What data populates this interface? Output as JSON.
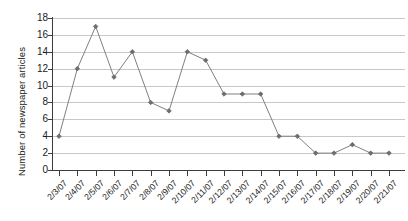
{
  "chart_data": {
    "type": "line",
    "title": "",
    "subtitle": "",
    "xlabel": "",
    "ylabel": "Number of newspaper articles",
    "categories": [
      "2/3/07",
      "2/4/07",
      "2/5/07",
      "2/6/07",
      "2/7/07",
      "2/8/07",
      "2/9/07",
      "2/10/07",
      "2/11/07",
      "2/12/07",
      "2/13/07",
      "2/14/07",
      "2/15/07",
      "2/16/07",
      "2/17/07",
      "2/18/07",
      "2/19/07",
      "2/20/07",
      "2/21/07"
    ],
    "values": [
      4,
      12,
      17,
      11,
      14,
      8,
      7,
      14,
      13,
      9,
      9,
      9,
      4,
      4,
      2,
      2,
      3,
      2,
      2
    ],
    "ylim": [
      0,
      18
    ],
    "ytick_step": 2,
    "yticks": [
      "0",
      "2",
      "4",
      "6",
      "8",
      "10",
      "12",
      "14",
      "16",
      "18"
    ],
    "grid": "horizontal",
    "legend": "none",
    "marker": "diamond",
    "series_color": "#808080",
    "grid_color": "#c8c8c8",
    "axis_color": "#3c3c3c",
    "background": "#ffffff"
  }
}
